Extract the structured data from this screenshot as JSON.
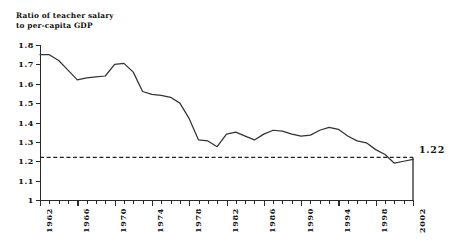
{
  "chart_data": {
    "type": "line",
    "title": "",
    "axis_title_lines": [
      "Ratio of teacher salary",
      "to per-capita GDP"
    ],
    "xlabel": "",
    "ylabel": "Ratio of teacher salary to per-capita GDP",
    "xlim": [
      1962,
      2002
    ],
    "ylim": [
      1,
      1.8
    ],
    "grid": false,
    "legend": "none",
    "ytick_labels": [
      "1.8",
      "1.7",
      "1.6",
      "1.5",
      "1.4",
      "1.3",
      "1.2",
      "1.1",
      "1"
    ],
    "ytick_values": [
      1.8,
      1.7,
      1.6,
      1.5,
      1.4,
      1.3,
      1.2,
      1.1,
      1.0
    ],
    "xtick_labels": [
      "1962",
      "1966",
      "1970",
      "1974",
      "1978",
      "1982",
      "1986",
      "1990",
      "1994",
      "1998",
      "2002"
    ],
    "xtick_values": [
      1962,
      1966,
      1970,
      1974,
      1978,
      1982,
      1986,
      1990,
      1994,
      1998,
      2002
    ],
    "xtick_minor_step": 1,
    "reference_line": {
      "value": 1.22,
      "style": "dashed",
      "label": "1.22"
    },
    "endpoint_annotation": {
      "label": "1.22",
      "x": 2002,
      "y": 1.22
    },
    "drop_line": {
      "x": 2002,
      "from": 1.22,
      "to": 1.0
    },
    "series": [
      {
        "name": "Ratio of teacher salary to per-capita GDP",
        "color": "#333333",
        "x": [
          1962,
          1963,
          1964,
          1965,
          1966,
          1967,
          1968,
          1969,
          1970,
          1971,
          1972,
          1973,
          1974,
          1975,
          1976,
          1977,
          1978,
          1979,
          1980,
          1981,
          1982,
          1983,
          1984,
          1985,
          1986,
          1987,
          1988,
          1989,
          1990,
          1991,
          1992,
          1993,
          1994,
          1995,
          1996,
          1997,
          1998,
          1999,
          2000,
          2001,
          2002
        ],
        "values": [
          1.75,
          1.75,
          1.72,
          1.67,
          1.62,
          1.63,
          1.635,
          1.64,
          1.7,
          1.705,
          1.66,
          1.56,
          1.545,
          1.54,
          1.53,
          1.5,
          1.42,
          1.31,
          1.305,
          1.275,
          1.34,
          1.35,
          1.33,
          1.31,
          1.34,
          1.36,
          1.355,
          1.34,
          1.33,
          1.335,
          1.36,
          1.375,
          1.365,
          1.33,
          1.305,
          1.295,
          1.26,
          1.235,
          1.19,
          1.2,
          1.21
        ]
      }
    ]
  }
}
